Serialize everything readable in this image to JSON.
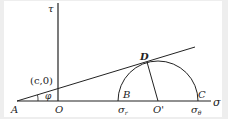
{
  "figure": {
    "type": "Mohr circle with strength envelope",
    "axes": {
      "horizontal": "σ",
      "vertical": "τ"
    },
    "points": {
      "A": "A",
      "O": "O",
      "B": "B",
      "C": "C",
      "D": "D",
      "O_prime": "O'"
    },
    "annotations": {
      "intercept": "(c,0)",
      "angle": "φ",
      "sigma_r": "σ",
      "sigma_r_sub": "r",
      "sigma_theta": "σ",
      "sigma_theta_sub": "θ"
    },
    "colors": {
      "line": "#222222",
      "background": "#ffffff",
      "frame": "#eeeeee"
    }
  }
}
